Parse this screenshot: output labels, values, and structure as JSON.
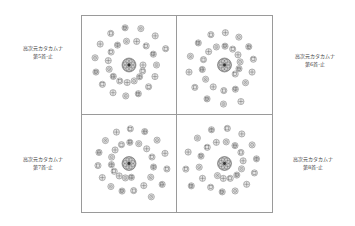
{
  "panels": [
    {
      "id": "p5",
      "title": "高次元カタカムナ",
      "subtitle": "第5首-止",
      "label_side": "left",
      "glyph_count_inner": 10,
      "glyph_count_outer": 20
    },
    {
      "id": "p6",
      "title": "高次元カタカムナ",
      "subtitle": "第6首-止",
      "label_side": "right",
      "glyph_count_inner": 10,
      "glyph_count_outer": 18
    },
    {
      "id": "p7",
      "title": "高次元カタカムナ",
      "subtitle": "第7首-止",
      "label_side": "left",
      "glyph_count_inner": 10,
      "glyph_count_outer": 20
    },
    {
      "id": "p8",
      "title": "高次元カタカムナ",
      "subtitle": "第8首-止",
      "label_side": "right",
      "glyph_count_inner": 10,
      "glyph_count_outer": 18
    }
  ],
  "colors": {
    "frame": "#9a9a9a",
    "glyph_stroke": "#555555",
    "glyph_fill": "#e6e6e6",
    "text": "#444444"
  }
}
